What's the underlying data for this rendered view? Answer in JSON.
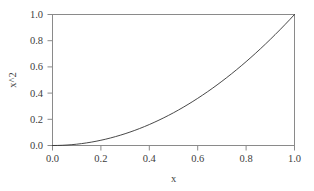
{
  "chart_data": {
    "type": "line",
    "title": "",
    "subtitle": "",
    "xlabel": "x",
    "ylabel": "x^2",
    "xlim": [
      0.0,
      1.0
    ],
    "ylim": [
      0.0,
      1.0
    ],
    "grid": false,
    "legend": false,
    "legend_position": "none",
    "xticks": [
      "0.0",
      "0.2",
      "0.4",
      "0.6",
      "0.8",
      "1.0"
    ],
    "xtick_values": [
      0.0,
      0.2,
      0.4,
      0.6,
      0.8,
      1.0
    ],
    "yticks": [
      "0.0",
      "0.2",
      "0.4",
      "0.6",
      "0.8",
      "1.0"
    ],
    "ytick_values": [
      0.0,
      0.2,
      0.4,
      0.6,
      0.8,
      1.0
    ],
    "series": [
      {
        "name": "x^2",
        "color": "#333333",
        "x": [
          0.0,
          0.02,
          0.04,
          0.06,
          0.08,
          0.1,
          0.12,
          0.14,
          0.16,
          0.18,
          0.2,
          0.22,
          0.24,
          0.26,
          0.28,
          0.3,
          0.32,
          0.34,
          0.36,
          0.38,
          0.4,
          0.42,
          0.44,
          0.46,
          0.48,
          0.5,
          0.52,
          0.54,
          0.56,
          0.58,
          0.6,
          0.62,
          0.64,
          0.66,
          0.68,
          0.7,
          0.72,
          0.74,
          0.76,
          0.78,
          0.8,
          0.82,
          0.84,
          0.86,
          0.88,
          0.9,
          0.92,
          0.94,
          0.96,
          0.98,
          1.0
        ],
        "values": [
          0.0,
          0.0004,
          0.0016,
          0.0036,
          0.0064,
          0.01,
          0.0144,
          0.0196,
          0.0256,
          0.0324,
          0.04,
          0.0484,
          0.0576,
          0.0676,
          0.0784,
          0.09,
          0.1024,
          0.1156,
          0.1296,
          0.1444,
          0.16,
          0.1764,
          0.1936,
          0.2116,
          0.2304,
          0.25,
          0.2704,
          0.2916,
          0.3136,
          0.3364,
          0.36,
          0.3844,
          0.4096,
          0.4356,
          0.4624,
          0.49,
          0.5184,
          0.5476,
          0.5776,
          0.6084,
          0.64,
          0.6724,
          0.7056,
          0.7396,
          0.7744,
          0.81,
          0.8464,
          0.8836,
          0.9216,
          0.9604,
          1.0
        ]
      }
    ],
    "annotations": [],
    "colors": {
      "curve": "#333333",
      "axis": "#8a8a8a",
      "text": "#3d3d3d",
      "background": "#ffffff"
    }
  }
}
